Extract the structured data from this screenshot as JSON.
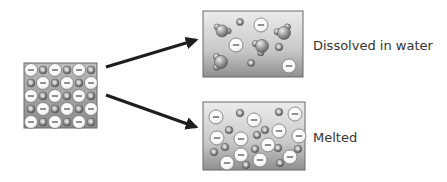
{
  "diagram": {
    "states": [
      {
        "id": "solid",
        "label": ""
      },
      {
        "id": "dissolved",
        "label": "Dissolved in water"
      },
      {
        "id": "melted",
        "label": "Melted"
      }
    ],
    "labels": {
      "dissolved": "Dissolved in water",
      "melted": "Melted"
    },
    "ion_symbols": {
      "anion": "−",
      "cation": "+"
    },
    "colors": {
      "box_border": "#6b6b6b",
      "box_fill_light": "#e6e6e6",
      "box_fill_dark": "#8c8c8c",
      "anion_fill": "#ffffff",
      "cation_fill": "#8a8a8a",
      "water_fill": "#9a9a9a",
      "arrow": "#1e1e1e"
    }
  }
}
